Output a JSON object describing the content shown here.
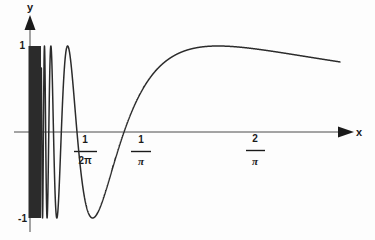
{
  "figure": {
    "background_color": "#fdfdfd",
    "curve_color": "#2b2b2b",
    "axis_color": "#3a3a3a",
    "text_color": "#1a1a1a"
  },
  "axes": {
    "x_axis_label": "x",
    "y_axis_label": "y",
    "x_arrow_icon": "arrow-right-icon",
    "y_arrow_icon": "arrow-up-icon",
    "y_ticks": [
      {
        "label": "1",
        "value": 1
      },
      {
        "label": "-1",
        "value": -1
      }
    ],
    "x_ticks": [
      {
        "numerator": "1",
        "denominator": "2π",
        "value": 0.1592
      },
      {
        "numerator": "1",
        "denominator": "π",
        "value": 0.3183
      },
      {
        "numerator": "2",
        "denominator": "π",
        "value": 0.6366
      }
    ]
  },
  "chart_data": {
    "type": "line",
    "title": "",
    "xlabel": "x",
    "ylabel": "y",
    "xlim": [
      0,
      1.05
    ],
    "ylim": [
      -1.08,
      1.08
    ],
    "grid": false,
    "legend": null,
    "function": "y = sin(1/x)",
    "annotations": [
      "dense oscillation region near x = 0",
      "amplitude bounded by y = 1 and y = -1"
    ],
    "series": [
      {
        "name": "sin(1/x)",
        "color": "#2b2b2b",
        "x": [
          0.0,
          0.01,
          0.02,
          0.03,
          0.04,
          0.05,
          0.06,
          0.07,
          0.08,
          0.09,
          0.1,
          0.11,
          0.12,
          0.13,
          0.14,
          0.15,
          0.1592,
          0.17,
          0.18,
          0.19,
          0.2,
          0.21,
          0.2122,
          0.22,
          0.23,
          0.24,
          0.25,
          0.26,
          0.27,
          0.28,
          0.29,
          0.3,
          0.3183,
          0.33,
          0.35,
          0.37,
          0.4,
          0.42,
          0.45,
          0.5,
          0.55,
          0.6,
          0.6366,
          0.7,
          0.75,
          0.8,
          0.85,
          0.9,
          0.95,
          1.0
        ],
        "y": [
          0.0,
          -0.506,
          0.262,
          0.991,
          -0.132,
          -0.912,
          0.397,
          0.99,
          -0.942,
          0.481,
          -0.544,
          0.994,
          -0.422,
          -0.361,
          0.96,
          -0.748,
          0.0,
          0.882,
          0.828,
          0.717,
          0.574,
          0.417,
          0.342,
          0.256,
          0.094,
          -0.062,
          -0.212,
          -0.353,
          -0.483,
          -0.602,
          -0.708,
          -0.801,
          -0.921,
          -0.97,
          -0.996,
          -0.956,
          -0.79,
          -0.653,
          -0.47,
          -0.183,
          0.029,
          0.202,
          0.297,
          0.477,
          0.563,
          0.634,
          0.694,
          0.744,
          0.786,
          0.841
        ]
      }
    ]
  }
}
